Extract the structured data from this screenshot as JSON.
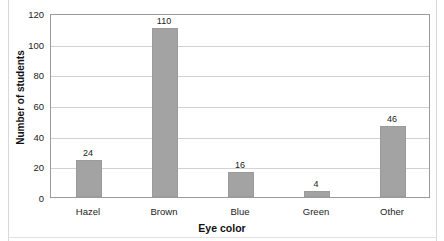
{
  "chart_data": {
    "type": "bar",
    "title": "",
    "xlabel": "Eye color",
    "ylabel": "Number of students",
    "categories": [
      "Hazel",
      "Brown",
      "Blue",
      "Green",
      "Other"
    ],
    "values": [
      24,
      110,
      16,
      4,
      46
    ],
    "value_labels": [
      "24",
      "110",
      "16",
      "4",
      "46"
    ],
    "ylim": [
      0,
      120
    ],
    "yticks": [
      0,
      20,
      40,
      60,
      80,
      100,
      120
    ],
    "ytick_labels": [
      "0",
      "20",
      "40",
      "60",
      "80",
      "100",
      "120"
    ],
    "grid": "horizontal",
    "legend": "none",
    "bar_color": "#a3a3a3",
    "bar_edge_color": "#9b9b9b",
    "gridline_color": "#d2d2d2",
    "axis_color": "#9a9a9a",
    "background_color": "#ffffff",
    "text_color": "#1c1c1c"
  }
}
